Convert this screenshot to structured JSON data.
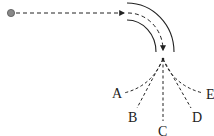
{
  "diagram": {
    "source": {
      "color": "#888888"
    },
    "outlets": [
      {
        "id": "A",
        "label": "A"
      },
      {
        "id": "B",
        "label": "B"
      },
      {
        "id": "C",
        "label": "C"
      },
      {
        "id": "D",
        "label": "D"
      },
      {
        "id": "E",
        "label": "E"
      }
    ],
    "colors": {
      "line": "#222222",
      "background": "#ffffff",
      "source_dot": "#888888"
    }
  }
}
